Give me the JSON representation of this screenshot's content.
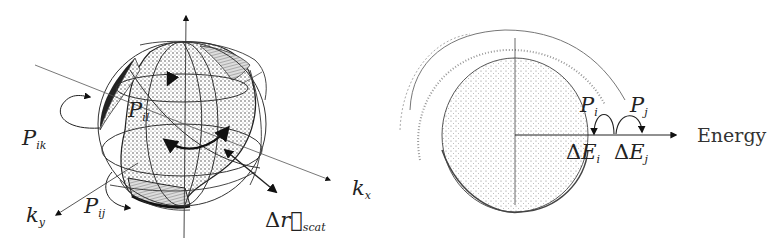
{
  "left_panel": {
    "title": "k-space valley sphere with scattering",
    "axes": {
      "kx": {
        "symbol": "k",
        "sub": "x"
      },
      "ky": {
        "symbol": "k",
        "sub": "y"
      },
      "kz": {
        "symbol": "",
        "sub": ""
      }
    },
    "labels": {
      "pik": {
        "symbol": "P",
        "sub": "ik"
      },
      "pil": {
        "symbol": "P",
        "sub": "il"
      },
      "pij": {
        "symbol": "P",
        "sub": "ij"
      },
      "dr": {
        "prefix": "Δ",
        "symbol": "r⃗",
        "sub": "scat"
      }
    }
  },
  "right_panel": {
    "title": "Energy shells",
    "axis_label": "Energy",
    "labels": {
      "pi": {
        "symbol": "P",
        "sub": "i"
      },
      "pj": {
        "symbol": "P",
        "sub": "j"
      },
      "dei": {
        "prefix": "Δ",
        "symbol": "E",
        "sub": "i"
      },
      "dej": {
        "prefix": "Δ",
        "symbol": "E",
        "sub": "j"
      }
    }
  },
  "colors": {
    "ink": "#1a1a1a",
    "stipple": "#555555",
    "background": "#ffffff"
  }
}
